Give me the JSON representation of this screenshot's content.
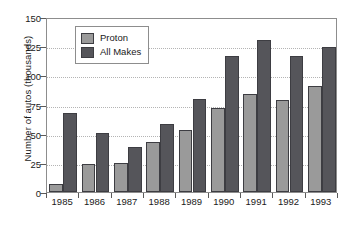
{
  "chart_data": {
    "type": "bar",
    "title": "",
    "xlabel": "",
    "ylabel": "Number of autos (thousands)",
    "categories": [
      "1985",
      "1986",
      "1987",
      "1988",
      "1989",
      "1990",
      "1991",
      "1992",
      "1993"
    ],
    "series": [
      {
        "name": "Proton",
        "values": [
          7,
          24,
          25,
          43,
          53,
          72,
          84,
          79,
          91
        ]
      },
      {
        "name": "All Makes",
        "values": [
          68,
          51,
          39,
          58,
          80,
          117,
          130,
          117,
          124
        ]
      }
    ],
    "ylim": [
      0,
      150
    ],
    "yticks": [
      0,
      25,
      50,
      75,
      100,
      125,
      150
    ],
    "ytick_labels": [
      "0",
      "25",
      "50",
      "75",
      "100",
      "125",
      "150"
    ],
    "grid": "horizontal-dotted",
    "legend_position": "top-left-inside",
    "colors": {
      "proton": "#9a9a9a",
      "all_makes": "#55555a",
      "bar_outline": "#3d3d42",
      "axis": "#8d8d8d",
      "gridline": "#b4b4b4",
      "background": "#ffffff",
      "text": "#1a1a1a"
    }
  },
  "legend": {
    "items": [
      {
        "label": "Proton",
        "swatch": "proton"
      },
      {
        "label": "All Makes",
        "swatch": "allmakes"
      }
    ]
  }
}
